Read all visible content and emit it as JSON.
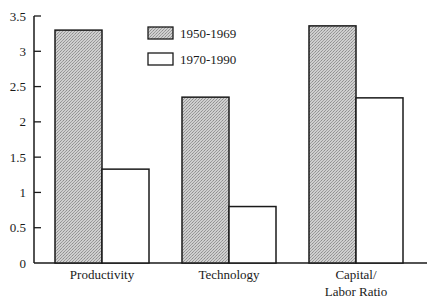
{
  "chart_data": {
    "type": "bar",
    "title": "",
    "xlabel": "",
    "ylabel": "",
    "categories": [
      "Productivity",
      "Technology",
      "Capital/\nLabor Ratio"
    ],
    "category_lines": [
      [
        "Productivity"
      ],
      [
        "Technology"
      ],
      [
        "Capital/",
        "Labor Ratio"
      ]
    ],
    "series": [
      {
        "name": "1950-1969",
        "values": [
          3.3,
          2.35,
          3.36
        ],
        "fill": "#c4c4c4",
        "pattern": "stipple"
      },
      {
        "name": "1970-1990",
        "values": [
          1.33,
          0.8,
          2.34
        ],
        "fill": "#ffffff",
        "pattern": "none"
      }
    ],
    "ylim": [
      0,
      3.5
    ],
    "yticks": [
      0,
      0.5,
      1,
      1.5,
      2,
      2.5,
      3,
      3.5
    ],
    "ytick_labels": [
      "0",
      "0.5",
      "1",
      "1.5",
      "2",
      "2.5",
      "3",
      "3.5"
    ],
    "grid": false,
    "legend_position": "top-center (inside plot)",
    "colors": {
      "axis": "#1a1a1a",
      "bar_outline": "#1a1a1a"
    }
  },
  "legend": {
    "items": [
      {
        "label": "1950-1969"
      },
      {
        "label": "1970-1990"
      }
    ]
  }
}
